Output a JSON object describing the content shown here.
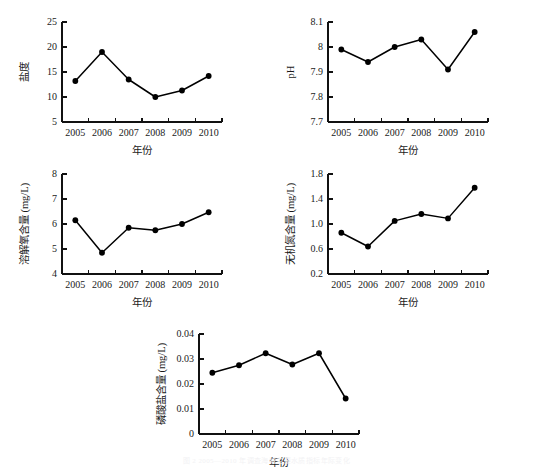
{
  "figure": {
    "background_color": "#ffffff",
    "ink_color": "#000000",
    "x_axis_title": "年份",
    "cut_off_caption": "图 2 2005—2010 年调查海域主要水质指标年际变化"
  },
  "chart_data": [
    {
      "id": "salinity",
      "type": "line",
      "title": "",
      "xlabel": "年份",
      "ylabel": "盐度",
      "categories": [
        "2005",
        "2006",
        "2007",
        "2008",
        "2009",
        "2010"
      ],
      "values": [
        13.2,
        19.0,
        13.5,
        10.0,
        11.3,
        14.2
      ],
      "ylim": [
        5,
        25
      ],
      "yticks": [
        5,
        10,
        15,
        20,
        25
      ],
      "ytick_labels": [
        "5",
        "10",
        "15",
        "20",
        "25"
      ],
      "grid": false,
      "legend": "none",
      "marker": "filled-circle",
      "line_color": "#000000"
    },
    {
      "id": "ph",
      "type": "line",
      "title": "",
      "xlabel": "年份",
      "ylabel": "pH",
      "categories": [
        "2005",
        "2006",
        "2007",
        "2008",
        "2009",
        "2010"
      ],
      "values": [
        7.99,
        7.94,
        8.0,
        8.03,
        7.91,
        8.06
      ],
      "ylim": [
        7.7,
        8.1
      ],
      "yticks": [
        7.7,
        7.8,
        7.9,
        8.0,
        8.1
      ],
      "ytick_labels": [
        "7.7",
        "7.8",
        "7.9",
        "8",
        "8.1"
      ],
      "grid": false,
      "legend": "none",
      "marker": "filled-circle",
      "line_color": "#000000"
    },
    {
      "id": "dissolved-oxygen",
      "type": "line",
      "title": "",
      "xlabel": "年份",
      "ylabel": "溶解氧含量 (mg/L)",
      "categories": [
        "2005",
        "2006",
        "2007",
        "2008",
        "2009",
        "2010"
      ],
      "values": [
        6.15,
        4.85,
        5.85,
        5.75,
        6.0,
        6.47
      ],
      "ylim": [
        4,
        8
      ],
      "yticks": [
        4,
        5,
        6,
        7,
        8
      ],
      "ytick_labels": [
        "4",
        "5",
        "6",
        "7",
        "8"
      ],
      "grid": false,
      "legend": "none",
      "marker": "filled-circle",
      "line_color": "#000000"
    },
    {
      "id": "inorganic-nitrogen",
      "type": "line",
      "title": "",
      "xlabel": "年份",
      "ylabel": "无机氮含量 (mg/L)",
      "categories": [
        "2005",
        "2006",
        "2007",
        "2008",
        "2009",
        "2010"
      ],
      "values": [
        0.86,
        0.64,
        1.05,
        1.16,
        1.09,
        1.58
      ],
      "ylim": [
        0.2,
        1.8
      ],
      "yticks": [
        0.2,
        0.6,
        1.0,
        1.4,
        1.8
      ],
      "ytick_labels": [
        "0.2",
        "0.6",
        "1.0",
        "1.4",
        "1.8"
      ],
      "grid": false,
      "legend": "none",
      "marker": "filled-circle",
      "line_color": "#000000"
    },
    {
      "id": "phosphate",
      "type": "line",
      "title": "",
      "xlabel": "年份",
      "ylabel": "磷酸盐含量 (mg/L)",
      "categories": [
        "2005",
        "2006",
        "2007",
        "2008",
        "2009",
        "2010"
      ],
      "values": [
        0.0245,
        0.0275,
        0.0323,
        0.0278,
        0.0323,
        0.0142
      ],
      "ylim": [
        0,
        0.04
      ],
      "yticks": [
        0,
        0.01,
        0.02,
        0.03,
        0.04
      ],
      "ytick_labels": [
        "0",
        "0.01",
        "0.02",
        "0.03",
        "0.04"
      ],
      "grid": false,
      "legend": "none",
      "marker": "filled-circle",
      "line_color": "#000000"
    }
  ],
  "panel_layout": [
    {
      "id": "salinity",
      "left": 12,
      "top": 8,
      "plot_w": 160,
      "plot_h": 100,
      "pad_left": 50,
      "pad_top": 14
    },
    {
      "id": "ph",
      "left": 278,
      "top": 8,
      "plot_w": 160,
      "plot_h": 100,
      "pad_left": 50,
      "pad_top": 14
    },
    {
      "id": "dissolved-oxygen",
      "left": 12,
      "top": 160,
      "plot_w": 160,
      "plot_h": 100,
      "pad_left": 50,
      "pad_top": 14
    },
    {
      "id": "inorganic-nitrogen",
      "left": 278,
      "top": 160,
      "plot_w": 160,
      "plot_h": 100,
      "pad_left": 50,
      "pad_top": 14
    },
    {
      "id": "phosphate",
      "left": 143,
      "top": 320,
      "plot_w": 160,
      "plot_h": 100,
      "pad_left": 56,
      "pad_top": 14
    }
  ]
}
